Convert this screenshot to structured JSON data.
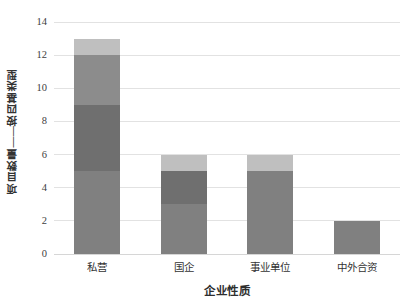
{
  "chart_data": {
    "type": "bar",
    "subtype": "stacked-vertical",
    "title": "",
    "xlabel": "企业性质",
    "ylabel": "项目数量——按四基类型",
    "categories": [
      "私营",
      "国企",
      "事业单位",
      "中外合资"
    ],
    "ytick_labels": [
      "0",
      "2",
      "4",
      "6",
      "8",
      "10",
      "12",
      "14"
    ],
    "ytick_values": [
      0,
      2,
      4,
      6,
      8,
      10,
      12,
      14
    ],
    "ylim": [
      0,
      14
    ],
    "grid": true,
    "legend": "none",
    "series": [
      {
        "name": "segment-1",
        "color": "#808080",
        "values": [
          5,
          3,
          5,
          2
        ]
      },
      {
        "name": "segment-2",
        "color": "#6f6f6f",
        "values": [
          4,
          2,
          0,
          0
        ]
      },
      {
        "name": "segment-3",
        "color": "#8c8c8c",
        "values": [
          3,
          0,
          0,
          0
        ]
      },
      {
        "name": "segment-4",
        "color": "#bfbfbf",
        "values": [
          1,
          1,
          1,
          0
        ]
      }
    ],
    "totals": [
      13,
      6,
      6,
      2
    ]
  },
  "colors": {
    "gridline": "#e2e2e2",
    "baseline": "#d6d6d6",
    "text": "#333333",
    "background": "#ffffff"
  }
}
